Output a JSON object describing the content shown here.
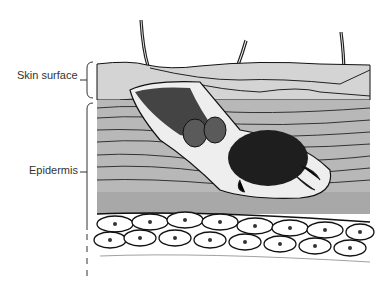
{
  "diagram": {
    "labels": [
      {
        "id": "skin-surface",
        "text": "Skin surface"
      },
      {
        "id": "epidermis",
        "text": "Epidermis"
      }
    ],
    "colors": {
      "background": "#ffffff",
      "surface_layer": "#d4d4d4",
      "epidermis_layer": "#b8b8b8",
      "granular_layer": "#a8a8a8",
      "mite_body": "#1e1e1e",
      "mite_eggs": "#5a5a5a",
      "outline": "#111111",
      "label_text": "#333333"
    }
  }
}
